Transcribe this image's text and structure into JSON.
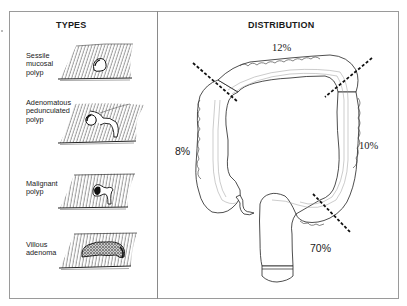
{
  "types_panel": {
    "title": "TYPES",
    "items": [
      {
        "label": "Sessile\nmucosal\npolyp",
        "icon": "sessile-polyp-illustration"
      },
      {
        "label": "Adenomatous\npedunculated\npolyp",
        "icon": "pedunculated-polyp-illustration"
      },
      {
        "label": "Malignant\npolyp",
        "icon": "malignant-polyp-illustration"
      },
      {
        "label": "Villous\nadenoma",
        "icon": "villous-adenoma-illustration"
      }
    ]
  },
  "distribution_panel": {
    "title": "DISTRIBUTION",
    "regions": [
      {
        "name": "transverse colon",
        "percent": "12%"
      },
      {
        "name": "ascending colon / cecum",
        "percent": "8%"
      },
      {
        "name": "descending colon",
        "percent": "10%"
      },
      {
        "name": "sigmoid colon / rectum",
        "percent": "70%"
      }
    ]
  },
  "colors": {
    "line": "#1a1a1a",
    "frame": "#9a9a9a",
    "background": "#ffffff"
  }
}
